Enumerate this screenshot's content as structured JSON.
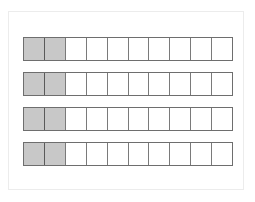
{
  "diagram": {
    "type": "fraction-bars",
    "rows": [
      {
        "cells": 10,
        "shaded": 2
      },
      {
        "cells": 10,
        "shaded": 2
      },
      {
        "cells": 10,
        "shaded": 2
      },
      {
        "cells": 10,
        "shaded": 2
      }
    ],
    "colors": {
      "shaded": "#c8c8c8",
      "unshaded": "#ffffff",
      "border": "#6e6e6e",
      "frame": "#ececec"
    }
  }
}
